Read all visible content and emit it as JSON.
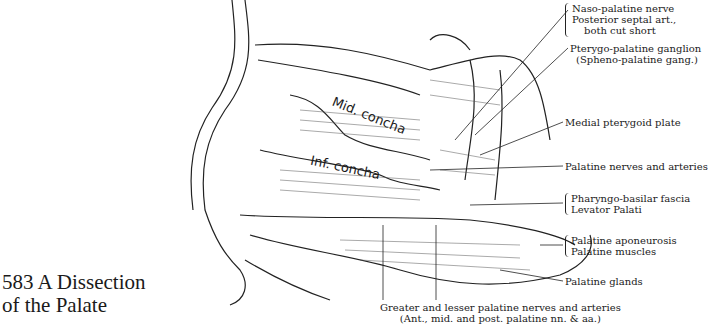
{
  "figure": {
    "number": "583",
    "title_line1": "583  A Dissection",
    "title_line2": "of the Palate"
  },
  "drawing_labels": {
    "mid_concha": "Mid. concha",
    "inf_concha": "Inf. concha"
  },
  "labels": [
    {
      "id": "naso-palatine",
      "lines": [
        "Naso-palatine nerve",
        "Posterior septal art.,",
        "   both cut short"
      ]
    },
    {
      "id": "pterygo-palatine",
      "lines": [
        "Pterygo-palatine ganglion",
        "(Spheno-palatine gang.)"
      ]
    },
    {
      "id": "medial-pterygoid",
      "lines": [
        "Medial pterygoid plate"
      ]
    },
    {
      "id": "palatine-nerves",
      "lines": [
        "Palatine nerves and arteries"
      ]
    },
    {
      "id": "pharyngo-basilar",
      "lines": [
        "Pharyngo-basilar fascia",
        "Levator Palati"
      ]
    },
    {
      "id": "palatine-aponeurosis",
      "lines": [
        "Palatine aponeurosis",
        "Palatine muscles"
      ]
    },
    {
      "id": "palatine-glands",
      "lines": [
        "Palatine glands"
      ]
    }
  ],
  "bottom_label": {
    "line1": "Greater and lesser palatine  nerves and arteries",
    "line2": "(Ant., mid. and post. palatine nn. & aa.)"
  }
}
